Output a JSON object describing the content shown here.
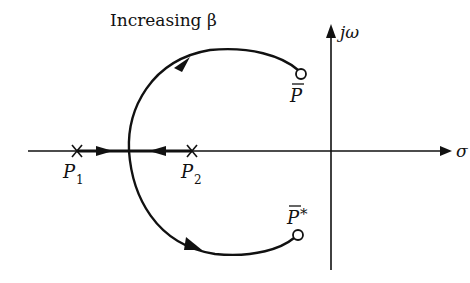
{
  "diagram": {
    "type": "root-locus",
    "title_label": "Increasing β",
    "axes": {
      "real_axis_label": "σ",
      "imag_axis_label": "jω"
    },
    "poles": [
      {
        "name": "P",
        "subscript": "1",
        "marker": "x"
      },
      {
        "name": "P",
        "subscript": "2",
        "marker": "x"
      }
    ],
    "zeros": [
      {
        "name": "P",
        "overbar": true,
        "suffix": "",
        "marker": "o"
      },
      {
        "name": "P",
        "overbar": true,
        "suffix": "*",
        "marker": "o"
      }
    ],
    "colors": {
      "stroke": "#111111",
      "background": "#ffffff"
    }
  }
}
